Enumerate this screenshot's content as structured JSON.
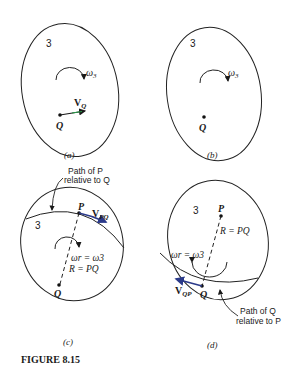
{
  "figure": {
    "caption": "FIGURE 8.15",
    "panels": [
      {
        "id": "a",
        "label": "(a)",
        "body_number": "3",
        "omega_label": "ω",
        "omega_sub": "3",
        "point_Q": "Q",
        "velocity_label": "V",
        "velocity_sub": "Q",
        "velocity_color": "#2a9d4a"
      },
      {
        "id": "b",
        "label": "(b)",
        "body_number": "3",
        "omega_label": "ω",
        "omega_sub": "3",
        "point_Q": "Q"
      },
      {
        "id": "c",
        "label": "(c)",
        "body_number": "3",
        "path_note_line1": "Path of P",
        "path_note_line2": "relative to Q",
        "point_P": "P",
        "point_Q": "Q",
        "velocity_label": "V",
        "velocity_sub": "PQ",
        "velocity_color": "#2b3a8a",
        "omega_eq": "ωr = ω3",
        "radius_eq": "R = PQ"
      },
      {
        "id": "d",
        "label": "(d)",
        "body_number": "3",
        "path_note_line1": "Path of Q",
        "path_note_line2": "relative to P",
        "point_P": "P",
        "point_Q": "Q",
        "velocity_label": "V",
        "velocity_sub": "QP",
        "velocity_color": "#2b3a8a",
        "omega_eq": "ωr = ω3",
        "radius_eq": "R = PQ"
      }
    ]
  }
}
